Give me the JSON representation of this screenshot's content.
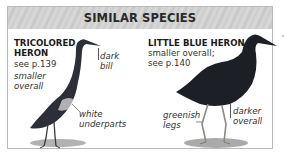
{
  "header": {
    "title": "SIMILAR SPECIES"
  },
  "species": [
    {
      "name_line1": "TRICOLORED",
      "name_line2": "HERON",
      "reference": "see p.139",
      "notes": [
        "smaller",
        "overall"
      ],
      "callouts": [
        {
          "line1": "dark",
          "line2": "bill"
        },
        {
          "line1": "white",
          "line2": "underparts"
        }
      ],
      "icon": "tricolored-heron-illustration"
    },
    {
      "name": "LITTLE BLUE HERON",
      "desc_line1": "smaller overall;",
      "desc_line2": "see p.140",
      "callouts": [
        {
          "line1": "greenish",
          "line2": "legs"
        },
        {
          "line1": "darker",
          "line2": "overall"
        }
      ],
      "icon": "little-blue-heron-illustration"
    }
  ]
}
